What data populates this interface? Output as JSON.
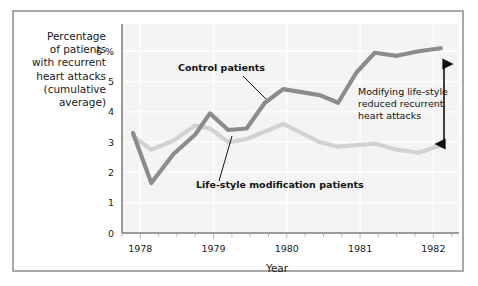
{
  "figure": {
    "border_color": "#a8a8a8",
    "background": "#ffffff"
  },
  "chart_data": {
    "type": "line",
    "title": "",
    "xlabel": "Year",
    "ylabel": "Percentage of patients with recurrent heart attacks (cumulative average)",
    "ylabel_lines": [
      "Percentage",
      "of patients",
      "with recurrent",
      "heart attacks",
      "(cumulative",
      "average)"
    ],
    "ylim": [
      0,
      6.9
    ],
    "xlim": [
      1977.75,
      1982.35
    ],
    "yticks": [
      0,
      1,
      2,
      3,
      4,
      5,
      6
    ],
    "ytick_labels": [
      "0",
      "1",
      "2",
      "3",
      "4",
      "5",
      "6 %"
    ],
    "xticks": [
      1978,
      1979,
      1980,
      1981,
      1982
    ],
    "xtick_labels": [
      "1978",
      "1979",
      "1980",
      "1981",
      "1982"
    ],
    "minor_xticks_per_year": 4,
    "grid": true,
    "grid_color": "#ffffff",
    "plot_background": "#f4f4f4",
    "legend_position": "inline-annotations",
    "series": [
      {
        "name": "Control patients",
        "color": "#8c8c8c",
        "x": [
          1977.9,
          1978.15,
          1978.45,
          1978.75,
          1978.95,
          1979.2,
          1979.45,
          1979.7,
          1979.95,
          1980.2,
          1980.45,
          1980.7,
          1980.95,
          1981.2,
          1981.5,
          1981.8,
          1982.1
        ],
        "values": [
          3.3,
          1.65,
          2.6,
          3.25,
          3.95,
          3.4,
          3.45,
          4.3,
          4.75,
          4.65,
          4.55,
          4.3,
          5.3,
          5.95,
          5.85,
          6.0,
          6.1
        ]
      },
      {
        "name": "Life-style modification patients",
        "color": "#d2d2d2",
        "x": [
          1977.9,
          1978.15,
          1978.45,
          1978.75,
          1978.95,
          1979.2,
          1979.45,
          1979.7,
          1979.95,
          1980.2,
          1980.45,
          1980.7,
          1980.95,
          1981.2,
          1981.5,
          1981.8,
          1982.1
        ],
        "values": [
          3.2,
          2.75,
          3.05,
          3.55,
          3.45,
          3.0,
          3.1,
          3.35,
          3.6,
          3.3,
          3.0,
          2.85,
          2.9,
          2.95,
          2.75,
          2.65,
          2.9
        ]
      }
    ],
    "annotations": [
      {
        "name": "control-patients-label",
        "text": "Control patients",
        "style": "bold"
      },
      {
        "name": "lifestyle-patients-label",
        "text": "Life-style modification patients",
        "style": "bold"
      },
      {
        "name": "gap-annotation",
        "lines": [
          "Modifying life-style",
          "reduced recurrent",
          "heart attacks"
        ],
        "text": "Modifying life-style reduced recurrent heart attacks",
        "arrow": "double-headed-vertical"
      }
    ]
  }
}
